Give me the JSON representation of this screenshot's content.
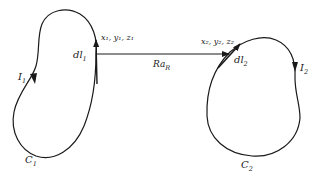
{
  "diagram": {
    "type": "magnetic-force-between-current-loops",
    "loop1": {
      "contour_label": "C",
      "contour_sub": "1",
      "current_label": "I",
      "current_sub": "1",
      "element_label": "dl",
      "element_sub": "1",
      "coord_label": "x₁, y₁, z₁"
    },
    "loop2": {
      "contour_label": "C",
      "contour_sub": "2",
      "current_label": "I",
      "current_sub": "2",
      "element_label": "dl",
      "element_sub": "2",
      "coord_label": "x₂, y₂, z₂"
    },
    "separation_vector": {
      "label": "Ra",
      "sub": "R"
    },
    "colors": {
      "stroke": "#1a1a1a",
      "background": "#ffffff"
    }
  }
}
